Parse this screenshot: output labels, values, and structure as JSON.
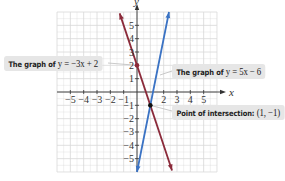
{
  "chart_data": {
    "type": "line",
    "title": "",
    "xlabel": "x",
    "ylabel": "y",
    "xlim": [
      -6,
      6
    ],
    "ylim": [
      -6,
      6
    ],
    "grid": true,
    "x_ticks": [
      -5,
      -4,
      -3,
      -2,
      -1,
      2,
      3,
      4,
      5
    ],
    "y_ticks": [
      -5,
      -4,
      -3,
      -2,
      -1,
      1,
      2,
      3,
      4,
      5
    ],
    "x_tick_labels": [
      "−5",
      "−4",
      "−3",
      "−2",
      "−1",
      "2",
      "3",
      "4",
      "5"
    ],
    "y_tick_labels": [
      "−5",
      "−4",
      "−3",
      "−2",
      "−1",
      "1",
      "2",
      "3",
      "4",
      "5"
    ],
    "series": [
      {
        "name": "y = −3x + 2",
        "slope": -3,
        "intercept": 2,
        "color": "#8b2a3a",
        "x_range": [
          -1.3,
          2.63
        ]
      },
      {
        "name": "y = 5x − 6",
        "slope": 5,
        "intercept": -6,
        "color": "#3b73c4",
        "x_range": [
          0,
          2.4
        ]
      }
    ],
    "points": [
      {
        "name": "intersection",
        "x": 1,
        "y": -1,
        "color": "#111111"
      },
      {
        "name": "y-intercept",
        "x": 0,
        "y": 2,
        "color": "#8b2a3a"
      }
    ],
    "annotations": [
      {
        "text_prefix": "The graph of",
        "math": "y = −3x + 2"
      },
      {
        "text_prefix": "The graph of",
        "math": "y = 5x − 6"
      },
      {
        "text_prefix": "Point of intersection:",
        "math": "(1, −1)"
      }
    ]
  }
}
